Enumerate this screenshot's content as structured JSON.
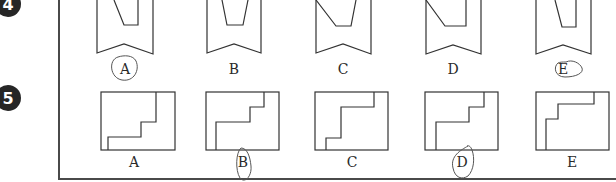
{
  "questions": [
    {
      "number": "4",
      "options": [
        {
          "label": "A",
          "circled": true
        },
        {
          "label": "B",
          "circled": false
        },
        {
          "label": "C",
          "circled": false
        },
        {
          "label": "D",
          "circled": false
        },
        {
          "label": "E",
          "circled": true
        }
      ]
    },
    {
      "number": "5",
      "options": [
        {
          "label": "A",
          "circled": false
        },
        {
          "label": "B",
          "circled": true
        },
        {
          "label": "C",
          "circled": false
        },
        {
          "label": "D",
          "circled": true
        },
        {
          "label": "E",
          "circled": false
        }
      ]
    }
  ],
  "colors": {
    "ink": "#2a2a2a",
    "badge": "#262626",
    "pencil": "#555555"
  }
}
